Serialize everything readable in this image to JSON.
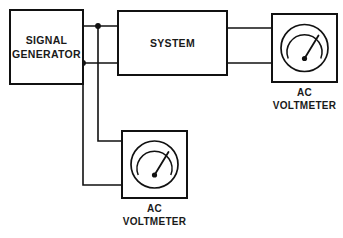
{
  "diagram": {
    "type": "block-diagram",
    "canvas": {
      "width": 343,
      "height": 238,
      "background": "#ffffff"
    },
    "line_color": "#111111",
    "text_color": "#1a1a1a"
  },
  "blocks": {
    "signal_generator": {
      "label_line1": "SIGNAL",
      "label_line2": "GENERATOR",
      "x": 10,
      "y": 10,
      "width": 73,
      "height": 74
    },
    "system": {
      "label": "SYSTEM",
      "x": 118,
      "y": 11,
      "width": 109,
      "height": 64
    },
    "voltmeter_right": {
      "label_line1": "AC",
      "label_line2": "VOLTMETER",
      "x": 272,
      "y": 14,
      "width": 65,
      "height": 68
    },
    "voltmeter_bottom": {
      "label_line1": "AC",
      "label_line2": "VOLTMETER",
      "x": 122,
      "y": 131,
      "width": 65,
      "height": 67
    }
  },
  "meters": {
    "instrument_type": "analog AC voltmeter",
    "dial": {
      "needle_direction": "up-right",
      "scale_arc": "open at bottom"
    }
  },
  "wiring": {
    "nets": [
      {
        "name": "generator-top-output-to-system",
        "from": "signal_generator.right.top",
        "to": "system.left.top"
      },
      {
        "name": "generator-bottom-output-to-system",
        "from": "signal_generator.right.bottom",
        "to": "system.left.bottom"
      },
      {
        "name": "tap-top-to-bottom-voltmeter",
        "from": "junction-top",
        "to": "voltmeter_bottom.left.top"
      },
      {
        "name": "tap-bottom-to-bottom-voltmeter",
        "from": "junction-bottom",
        "to": "voltmeter_bottom.left.bottom"
      },
      {
        "name": "system-top-output-to-right-voltmeter",
        "from": "system.right.top",
        "to": "voltmeter_right.left.top"
      },
      {
        "name": "system-bottom-output-to-right-voltmeter",
        "from": "system.right.bottom",
        "to": "voltmeter_right.left.bottom"
      }
    ],
    "junctions": [
      {
        "name": "junction-top",
        "x": 98,
        "y": 26
      },
      {
        "name": "junction-bottom",
        "x": 83,
        "y": 63
      }
    ]
  }
}
